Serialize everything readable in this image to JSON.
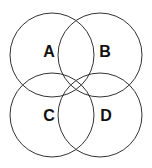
{
  "diagram": {
    "type": "venn-4-circles",
    "stroke_color": "#333333",
    "circles": [
      {
        "label": "A",
        "cx": 52,
        "cy": 55,
        "r": 42
      },
      {
        "label": "B",
        "cx": 100,
        "cy": 55,
        "r": 42
      },
      {
        "label": "C",
        "cx": 52,
        "cy": 115,
        "r": 42
      },
      {
        "label": "D",
        "cx": 100,
        "cy": 115,
        "r": 42
      }
    ]
  }
}
